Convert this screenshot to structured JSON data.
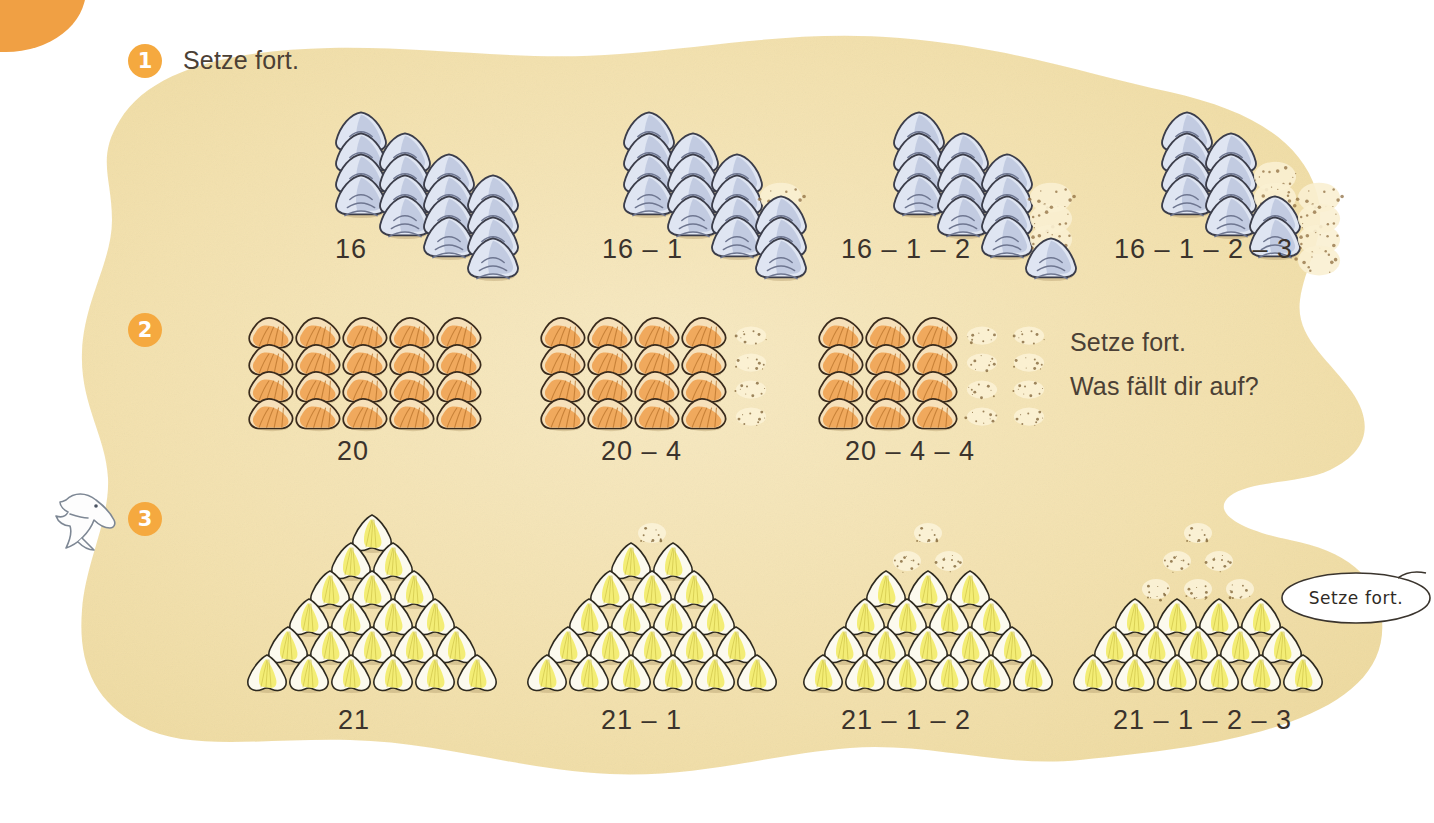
{
  "page": {
    "background_color": "#ffffff",
    "sand_color": "#f3e2b4",
    "accent_color": "#f5a93f",
    "text_color": "#4b4035"
  },
  "corner_tab": {
    "name": "orange-corner-tab",
    "color": "#f0a044"
  },
  "mascot": {
    "name": "dolphin-mascot"
  },
  "exercises": [
    {
      "number": "1",
      "instruction": "Setze fort.",
      "shell_color": "#c3cbe4",
      "layout": "diamond",
      "groups": [
        {
          "caption": "16",
          "filled": 16,
          "faded": 0
        },
        {
          "caption": "16 – 1",
          "filled": 15,
          "faded": 1
        },
        {
          "caption": "16 – 1 – 2",
          "filled": 13,
          "faded": 3
        },
        {
          "caption": "16 – 1 – 2 – 3",
          "filled": 10,
          "faded": 6
        }
      ]
    },
    {
      "number": "2",
      "instruction_line1": "Setze fort.",
      "instruction_line2": "Was fällt dir auf?",
      "shell_color": "#e8a householder",
      "layout": "grid-4x5",
      "groups": [
        {
          "caption": "20",
          "filled_columns": 5,
          "faded_columns": 0
        },
        {
          "caption": "20 – 4",
          "filled_columns": 4,
          "faded_columns": 1
        },
        {
          "caption": "20 – 4 – 4",
          "filled_columns": 3,
          "faded_columns": 2
        }
      ]
    },
    {
      "number": "3",
      "bubble_text": "Setze fort.",
      "shell_color": "#f2ea72",
      "layout": "triangle",
      "groups": [
        {
          "caption": "21",
          "filled_rows": 6,
          "faded_rows": 0
        },
        {
          "caption": "21 – 1",
          "filled_rows": 5,
          "faded_rows": 1
        },
        {
          "caption": "21 – 1 – 2",
          "filled_rows": 4,
          "faded_rows": 2
        },
        {
          "caption": "21 – 1 – 2 – 3",
          "filled_rows": 3,
          "faded_rows": 3
        }
      ]
    }
  ],
  "captions": {
    "r1c1": "16",
    "r1c2": "16 – 1",
    "r1c3": "16 – 1 – 2",
    "r1c4": "16 – 1 – 2 – 3",
    "r2c1": "20",
    "r2c2": "20 – 4",
    "r2c3": "20 – 4 – 4",
    "r3c1": "21",
    "r3c2": "21 – 1",
    "r3c3": "21 – 1 – 2",
    "r3c4": "21 – 1 – 2 – 3"
  },
  "labels": {
    "badge1": "1",
    "badge2": "2",
    "badge3": "3",
    "instr1": "Setze fort.",
    "instr2a": "Setze fort.",
    "instr2b": "Was fällt dir auf?",
    "bubble": "Setze fort."
  }
}
